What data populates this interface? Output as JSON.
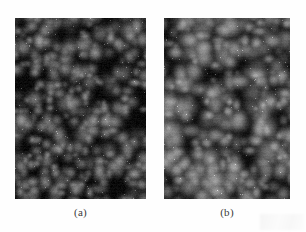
{
  "figure": {
    "kind": "micrograph-pair",
    "background_color": "#fefefe",
    "caption_color": "#3a3a3a",
    "panels": [
      {
        "id": "a",
        "caption": "(a)",
        "alt": "grayscale surface micrograph, fine rounded grains on dark background",
        "x": 15,
        "y": 18,
        "width": 131,
        "height": 181,
        "background_color": "#0b0b0b",
        "grain_color_low": "#2a2a2a",
        "grain_color_high": "#c8c8c8",
        "mean_gray": 62,
        "grain_count": 430,
        "grain_radius_min": 3.2,
        "grain_radius_max": 8.4,
        "noise_amount": 16,
        "seed": 20110427
      },
      {
        "id": "b",
        "caption": "(b)",
        "alt": "grayscale surface micrograph, larger brighter agglomerated grains",
        "x": 164,
        "y": 18,
        "width": 126,
        "height": 181,
        "background_color": "#101010",
        "grain_color_low": "#333333",
        "grain_color_high": "#d6d6d6",
        "mean_gray": 84,
        "grain_count": 360,
        "grain_radius_min": 4.0,
        "grain_radius_max": 11.0,
        "noise_amount": 14,
        "seed": 77300815
      }
    ]
  }
}
